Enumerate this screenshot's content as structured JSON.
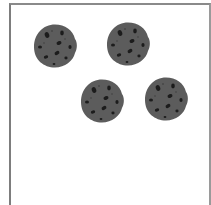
{
  "scene": {
    "description": "Four chocolate chip cookies inside a bordered box",
    "count": 4,
    "colors": {
      "cookie": "#5c5c5c",
      "chip": "#1c1c1c",
      "border": "#7d7d7d",
      "background": "#ffffff"
    },
    "cookies": [
      {
        "id": "cookie-1",
        "cx": 54,
        "cy": 45,
        "r": 22
      },
      {
        "id": "cookie-2",
        "cx": 127,
        "cy": 44,
        "r": 22
      },
      {
        "id": "cookie-3",
        "cx": 101,
        "cy": 101,
        "r": 22
      },
      {
        "id": "cookie-4",
        "cx": 166,
        "cy": 99,
        "r": 22
      }
    ]
  }
}
